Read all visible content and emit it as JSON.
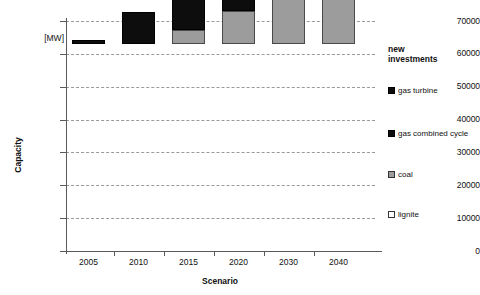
{
  "chart_data": {
    "type": "bar",
    "stacked": true,
    "title": "",
    "xlabel": "Scenario",
    "ylabel": "Capacity",
    "yunit": "[MW]",
    "ylim": [
      0,
      70000
    ],
    "ytick_values": [
      0,
      10000,
      20000,
      30000,
      40000,
      50000,
      60000,
      70000
    ],
    "ytick_labels": [
      "0",
      "10000",
      "20000",
      "30000",
      "40000",
      "50000",
      "60000",
      "70000"
    ],
    "grid": "horizontal-dashed",
    "categories": [
      "2005",
      "2010",
      "2015",
      "2020",
      "2030",
      "2040"
    ],
    "series": [
      {
        "name": "lignite",
        "color": "#ffffff",
        "values": [
          0,
          0,
          0,
          0,
          0,
          0
        ]
      },
      {
        "name": "coal",
        "color": "#9c9c9c",
        "values": [
          0,
          0,
          4300,
          10200,
          26800,
          32900
        ]
      },
      {
        "name": "gas combined cycle",
        "color": "#0d0d0d",
        "values": [
          0,
          0,
          0,
          0,
          0,
          0
        ]
      },
      {
        "name": "gas turbine",
        "color": "#0d0d0d",
        "values": [
          1300,
          9800,
          18800,
          23000,
          31700,
          35600
        ]
      }
    ],
    "totals": [
      1300,
      9800,
      23100,
      33200,
      58500,
      68500
    ],
    "legend_position": "right",
    "legend_title": "new investments",
    "legend_entries": [
      {
        "label": "gas turbine",
        "swatch": "black"
      },
      {
        "label": "gas combined cycle",
        "swatch": "black"
      },
      {
        "label": "coal",
        "swatch": "gray"
      },
      {
        "label": "lignite",
        "swatch": "white"
      }
    ]
  },
  "axes": {
    "y_title": "Capacity",
    "y_unit": "[MW]",
    "x_title": "Scenario",
    "yticks": [
      {
        "label": "70000"
      },
      {
        "label": "60000"
      },
      {
        "label": "50000"
      },
      {
        "label": "40000"
      },
      {
        "label": "30000"
      },
      {
        "label": "20000"
      },
      {
        "label": "10000"
      },
      {
        "label": "0"
      }
    ],
    "xticks": [
      {
        "label": "2005"
      },
      {
        "label": "2010"
      },
      {
        "label": "2015"
      },
      {
        "label": "2020"
      },
      {
        "label": "2030"
      },
      {
        "label": "2040"
      }
    ]
  },
  "legend": {
    "title_line1": "new",
    "title_line2": "investments",
    "items": [
      {
        "label": "gas turbine"
      },
      {
        "label": "gas combined cycle"
      },
      {
        "label": "coal"
      },
      {
        "label": "lignite"
      }
    ]
  }
}
